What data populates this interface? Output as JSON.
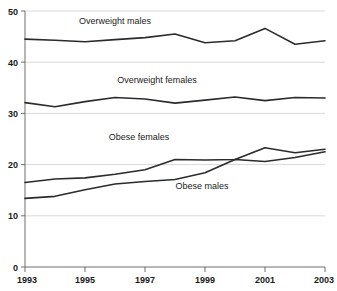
{
  "chart_data": {
    "type": "line",
    "title": "",
    "subtitle": "",
    "xlabel": "",
    "ylabel": "",
    "x": [
      1993,
      1994,
      1995,
      1996,
      1997,
      1998,
      1999,
      2000,
      2001,
      2002,
      2003
    ],
    "xlim": [
      1993,
      2003
    ],
    "ylim": [
      0,
      50
    ],
    "x_tick_labels": [
      "1993",
      "1995",
      "1997",
      "1999",
      "2001",
      "2003"
    ],
    "x_tick_values": [
      1993,
      1995,
      1997,
      1999,
      2001,
      2003
    ],
    "y_tick_labels": [
      "0",
      "10",
      "20",
      "30",
      "40",
      "50"
    ],
    "y_tick_values": [
      0,
      10,
      20,
      30,
      40,
      50
    ],
    "grid": "horizontal",
    "legend": "inline-annotations",
    "series": [
      {
        "name": "Overweight males",
        "label": "Overweight males",
        "color": "#2b2b2b",
        "values": [
          44.5,
          44.3,
          44.0,
          44.4,
          44.8,
          45.5,
          43.8,
          44.2,
          46.6,
          43.5,
          44.2
        ]
      },
      {
        "name": "Overweight females",
        "label": "Overweight females",
        "color": "#2b2b2b",
        "values": [
          32.1,
          31.3,
          32.3,
          33.1,
          32.8,
          32.0,
          32.6,
          33.2,
          32.5,
          33.1,
          33.0
        ]
      },
      {
        "name": "Obese females",
        "label": "Obese females",
        "color": "#2b2b2b",
        "values": [
          16.5,
          17.2,
          17.4,
          18.1,
          19.0,
          21.0,
          20.9,
          21.0,
          23.3,
          22.3,
          23.0
        ]
      },
      {
        "name": "Obese males",
        "label": "Obese males",
        "color": "#2b2b2b",
        "values": [
          13.4,
          13.8,
          15.1,
          16.2,
          16.7,
          17.1,
          18.4,
          21.0,
          20.6,
          21.4,
          22.5
        ]
      }
    ],
    "annotations": [
      {
        "text": "Overweight males",
        "x": 1996.0,
        "y": 47.5
      },
      {
        "text": "Overweight females",
        "x": 1997.4,
        "y": 36.0
      },
      {
        "text": "Obese females",
        "x": 1996.8,
        "y": 24.8
      },
      {
        "text": "Obese males",
        "x": 1998.9,
        "y": 15.2
      }
    ]
  }
}
